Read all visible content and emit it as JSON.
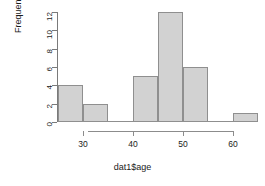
{
  "chart_data": {
    "type": "bar",
    "title": "",
    "subtitle": "",
    "xlabel": "dat1$age",
    "ylabel": "Frequency",
    "bin_width": 5,
    "bin_edges": [
      25,
      30,
      35,
      40,
      45,
      50,
      55,
      60,
      65
    ],
    "categories": [
      "25-30",
      "30-35",
      "35-40",
      "40-45",
      "45-50",
      "50-55",
      "55-60",
      "60-65"
    ],
    "values": [
      4,
      2,
      0,
      5,
      12,
      6,
      0,
      1
    ],
    "xlim": [
      25,
      65
    ],
    "ylim": [
      0,
      12
    ],
    "x_ticks": [
      30,
      40,
      50,
      60
    ],
    "x_tick_labels": [
      "30",
      "40",
      "50",
      "60"
    ],
    "y_ticks": [
      0,
      2,
      4,
      6,
      8,
      10,
      12
    ],
    "y_tick_labels": [
      "0",
      "2",
      "4",
      "6",
      "8",
      "10",
      "12"
    ],
    "grid": false,
    "legend": false,
    "legend_position": "none",
    "bar_fill_color": "#d2d2d2",
    "bar_border_color": "#8f8f8f",
    "axis_color": "#7a7a7a",
    "text_color": "#1a1a1a",
    "background_color": "#ffffff"
  },
  "axes": {
    "y": {
      "title": "Frequency",
      "ticks": [
        {
          "value": 12,
          "label": "12"
        },
        {
          "value": 10,
          "label": "10"
        },
        {
          "value": 8,
          "label": "8"
        },
        {
          "value": 6,
          "label": "6"
        },
        {
          "value": 4,
          "label": "4"
        },
        {
          "value": 2,
          "label": "2"
        },
        {
          "value": 0,
          "label": "0"
        }
      ]
    },
    "x": {
      "title": "dat1$age",
      "ticks": [
        {
          "value": 30,
          "label": "30"
        },
        {
          "value": 40,
          "label": "40"
        },
        {
          "value": 50,
          "label": "50"
        },
        {
          "value": 60,
          "label": "60"
        }
      ]
    }
  }
}
